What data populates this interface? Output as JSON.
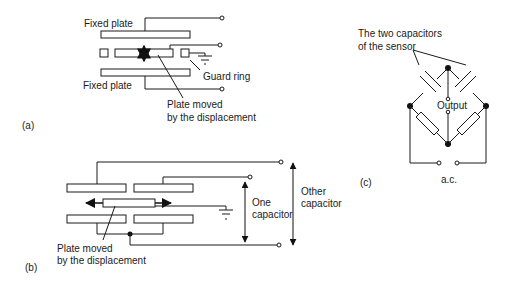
{
  "colors": {
    "line": "#1a1a1a",
    "background": "#ffffff"
  },
  "panel_a": {
    "label": "(a)",
    "fixed_plate_top": "Fixed plate",
    "fixed_plate_bottom": "Fixed plate",
    "guard_ring": "Guard ring",
    "moving_plate_line1": "Plate moved",
    "moving_plate_line2": "by the displacement"
  },
  "panel_b": {
    "label": "(b)",
    "moving_plate_line1": "Plate moved",
    "moving_plate_line2": "by the displacement",
    "one_capacitor_line1": "One",
    "one_capacitor_line2": "capacitor",
    "other_capacitor_line1": "Other",
    "other_capacitor_line2": "capacitor"
  },
  "panel_c": {
    "label": "(c)",
    "caption_line1": "The two capacitors",
    "caption_line2": "of the sensor",
    "output": "Output",
    "supply": "a.c."
  }
}
